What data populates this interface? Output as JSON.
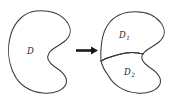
{
  "figure": {
    "type": "math-diagram",
    "background_color": "#ffffff",
    "stroke_color": "#3a3a3a",
    "arrow_color": "#1a1a1a",
    "left_panel": {
      "name": "undivided-region",
      "label": {
        "base": "D",
        "subscript": ""
      }
    },
    "arrow": {
      "name": "transformation-arrow",
      "direction": "right",
      "glyph": "→"
    },
    "right_panel": {
      "name": "divided-region",
      "labels": [
        {
          "base": "D",
          "subscript": "1"
        },
        {
          "base": "D",
          "subscript": "2"
        }
      ],
      "divider": {
        "name": "cut-line",
        "description": "curve splitting the region into D1 and D2"
      }
    }
  }
}
